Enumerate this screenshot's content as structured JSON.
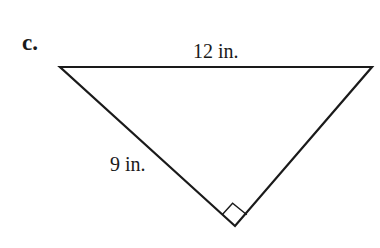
{
  "figure": {
    "part_label": "c.",
    "labels": {
      "top_side": "12 in.",
      "left_side": "9 in."
    },
    "triangle": {
      "vertices": {
        "left": [
          60,
          67
        ],
        "right": [
          372,
          67
        ],
        "bottom": [
          235,
          226
        ]
      },
      "right_angle_at": "bottom",
      "stroke_color": "#1a1a1a"
    }
  }
}
